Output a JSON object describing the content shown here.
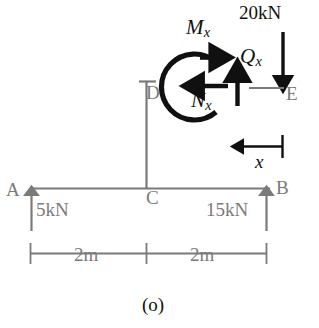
{
  "figure": {
    "caption": "(o)",
    "colors": {
      "structure": "#7a7a7a",
      "internal_force": "#101010",
      "background": "#ffffff"
    },
    "points": {
      "a": "A",
      "b": "B",
      "c": "C",
      "d": "D",
      "e": "E"
    },
    "reactions": {
      "a_label": "5kN",
      "b_label": "15kN"
    },
    "loads": {
      "e_label": "20kN"
    },
    "internal_forces": {
      "moment": {
        "symbol": "M",
        "subscript": "x"
      },
      "normal": {
        "symbol": "N",
        "subscript": "x"
      },
      "shear": {
        "symbol": "Q",
        "subscript": "x"
      }
    },
    "dimensions": {
      "x_label": "x",
      "left_span": "2m",
      "right_span": "2m"
    }
  }
}
